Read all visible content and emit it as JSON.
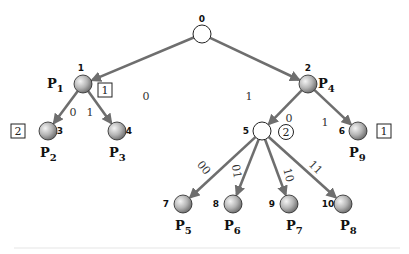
{
  "diagram": {
    "type": "tree",
    "colors": {
      "edge": "#6e6e6e",
      "leaf_fill_light": "#f2f2f2",
      "leaf_fill_dark": "#7a7a7a",
      "internal_fill": "#ffffff",
      "outline": "#222222"
    },
    "nodes": [
      {
        "id": "0",
        "x": 202,
        "y": 34,
        "kind": "empty",
        "num_dx": 0,
        "num_dy": -12,
        "p": null,
        "p_sub": null
      },
      {
        "id": "1",
        "x": 83,
        "y": 84,
        "kind": "filled",
        "num_dx": -2,
        "num_dy": -13,
        "p": "P",
        "p_sub": "1",
        "p_dx": -36,
        "p_dy": 4
      },
      {
        "id": "2",
        "x": 308,
        "y": 84,
        "kind": "filled",
        "num_dx": 0,
        "num_dy": -13,
        "p": "P",
        "p_sub": "4",
        "p_dx": 10,
        "p_dy": 4
      },
      {
        "id": "3",
        "x": 48,
        "y": 131,
        "kind": "filled",
        "num_dx": 12,
        "num_dy": 3,
        "p": "P",
        "p_sub": "2",
        "p_dx": -8,
        "p_dy": 26
      },
      {
        "id": "4",
        "x": 117,
        "y": 131,
        "kind": "filled",
        "num_dx": 12,
        "num_dy": 3,
        "p": "P",
        "p_sub": "3",
        "p_dx": -8,
        "p_dy": 26
      },
      {
        "id": "5",
        "x": 262,
        "y": 131,
        "kind": "empty",
        "num_dx": -16,
        "num_dy": 3,
        "p": null,
        "p_sub": null
      },
      {
        "id": "6",
        "x": 358,
        "y": 131,
        "kind": "filled",
        "num_dx": -16,
        "num_dy": 3,
        "p": "P",
        "p_sub": "9",
        "p_dx": -9,
        "p_dy": 26
      },
      {
        "id": "7",
        "x": 183,
        "y": 204,
        "kind": "filled",
        "num_dx": -17,
        "num_dy": 3,
        "p": "P",
        "p_sub": "5",
        "p_dx": -8,
        "p_dy": 26
      },
      {
        "id": "8",
        "x": 233,
        "y": 204,
        "kind": "filled",
        "num_dx": -17,
        "num_dy": 3,
        "p": "P",
        "p_sub": "6",
        "p_dx": -9,
        "p_dy": 26
      },
      {
        "id": "9",
        "x": 289,
        "y": 204,
        "kind": "filled",
        "num_dx": -17,
        "num_dy": 3,
        "p": "P",
        "p_sub": "7",
        "p_dx": -3,
        "p_dy": 26
      },
      {
        "id": "10",
        "x": 343,
        "y": 204,
        "kind": "filled",
        "num_dx": -15,
        "num_dy": 3,
        "p": "P",
        "p_sub": "8",
        "p_dx": -3,
        "p_dy": 26
      }
    ],
    "edges": [
      {
        "from": "0",
        "to": "1",
        "label": "0",
        "lx": 146,
        "ly": 100,
        "rot": 0
      },
      {
        "from": "0",
        "to": "2",
        "label": "1",
        "lx": 249,
        "ly": 100,
        "rot": 0
      },
      {
        "from": "1",
        "to": "3",
        "label": "0",
        "lx": 73,
        "ly": 116,
        "rot": 0
      },
      {
        "from": "1",
        "to": "4",
        "label": "1",
        "lx": 90,
        "ly": 116,
        "rot": 0
      },
      {
        "from": "2",
        "to": "5",
        "label": "0",
        "lx": 289,
        "ly": 122,
        "rot": 0
      },
      {
        "from": "2",
        "to": "6",
        "label": "1",
        "lx": 325,
        "ly": 126,
        "rot": 0
      },
      {
        "from": "5",
        "to": "7",
        "label": "00",
        "lx": 201,
        "ly": 170,
        "rot": 50
      },
      {
        "from": "5",
        "to": "8",
        "label": "01",
        "lx": 233,
        "ly": 172,
        "rot": 80
      },
      {
        "from": "5",
        "to": "9",
        "label": "10",
        "lx": 285,
        "ly": 176,
        "rot": 75
      },
      {
        "from": "5",
        "to": "10",
        "label": "11",
        "lx": 313,
        "ly": 170,
        "rot": 45
      }
    ],
    "boxes": [
      {
        "node": "1",
        "text": "1",
        "x": 98,
        "y": 83
      },
      {
        "node": "3",
        "text": "2",
        "x": 11,
        "y": 124
      },
      {
        "node": "6",
        "text": "1",
        "x": 377,
        "y": 124
      }
    ],
    "rings": [
      {
        "node": "5",
        "text": "2",
        "cx": 286,
        "cy": 132
      }
    ]
  }
}
